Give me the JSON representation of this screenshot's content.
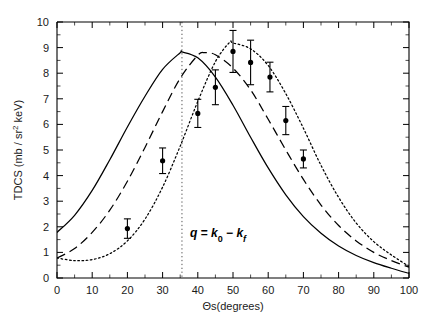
{
  "chart_data": {
    "type": "scatter",
    "title": "",
    "xlabel": "Θs(degrees)",
    "ylabel": "TDCS (mb / sr² keV)",
    "xlim": [
      0,
      100
    ],
    "ylim": [
      0,
      10
    ],
    "grid": false,
    "legend": "none",
    "x_ticks_major": [
      0,
      10,
      20,
      30,
      40,
      50,
      60,
      70,
      80,
      90,
      100
    ],
    "x_ticks_minor": [
      5,
      15,
      25,
      35,
      45,
      55,
      65,
      75,
      85,
      95
    ],
    "y_ticks_major": [
      0,
      1,
      2,
      3,
      4,
      5,
      6,
      7,
      8,
      9,
      10
    ],
    "y_ticks_minor": [
      0.5,
      1.5,
      2.5,
      3.5,
      4.5,
      5.5,
      6.5,
      7.5,
      8.5,
      9.5
    ],
    "annotations": [
      {
        "name": "momentum-transfer-label",
        "text": "q = k0 - kf",
        "x": 40,
        "y": 1.85
      }
    ],
    "vertical_reference_line": {
      "name": "momentum-transfer-direction",
      "style": "dotted",
      "x": 35.5
    },
    "series": [
      {
        "name": "experiment",
        "style": "points-with-errorbars",
        "marker": "filled-circle",
        "x": [
          20,
          30,
          40,
          45,
          50,
          55,
          60.5,
          65,
          70
        ],
        "values": [
          1.93,
          4.58,
          6.43,
          7.45,
          8.85,
          8.42,
          7.85,
          6.15,
          4.65
        ],
        "yerr": [
          0.38,
          0.5,
          0.55,
          0.68,
          0.82,
          0.87,
          0.58,
          0.55,
          0.35
        ]
      },
      {
        "name": "theory-curve-1",
        "style": "solid",
        "peak_x": 35.5,
        "peak_y": 8.83,
        "x": [
          0,
          5,
          10,
          15,
          20,
          25,
          30,
          35,
          35.5,
          40,
          45,
          50,
          55,
          60,
          65,
          70,
          75,
          80,
          85,
          90,
          95,
          100
        ],
        "values": [
          1.78,
          2.45,
          3.42,
          4.62,
          5.9,
          7.1,
          8.15,
          8.8,
          8.83,
          8.6,
          7.85,
          6.75,
          5.5,
          4.3,
          3.25,
          2.4,
          1.75,
          1.25,
          0.88,
          0.6,
          0.38,
          0.18
        ]
      },
      {
        "name": "theory-curve-2",
        "style": "dashed",
        "peak_x": 42,
        "peak_y": 8.8,
        "x": [
          0,
          5,
          10,
          15,
          20,
          25,
          30,
          35,
          40,
          42,
          45,
          50,
          55,
          60,
          65,
          70,
          75,
          80,
          85,
          90,
          95,
          100
        ],
        "values": [
          0.78,
          1.15,
          1.78,
          2.65,
          3.78,
          5.1,
          6.5,
          7.8,
          8.7,
          8.8,
          8.72,
          8.2,
          7.35,
          6.2,
          5.0,
          3.85,
          2.85,
          2.05,
          1.45,
          1.0,
          0.68,
          0.42
        ]
      },
      {
        "name": "theory-curve-3",
        "style": "dotted",
        "peak_x": 49,
        "peak_y": 9.2,
        "x": [
          0,
          5,
          10,
          15,
          20,
          25,
          30,
          35,
          40,
          45,
          49,
          50,
          55,
          60,
          65,
          70,
          75,
          80,
          85,
          90,
          95,
          100
        ],
        "values": [
          0.78,
          0.68,
          0.72,
          0.95,
          1.45,
          2.3,
          3.55,
          5.15,
          6.9,
          8.45,
          9.2,
          9.18,
          8.95,
          8.3,
          7.2,
          5.85,
          4.4,
          3.15,
          2.15,
          1.42,
          0.9,
          0.45
        ]
      }
    ]
  }
}
